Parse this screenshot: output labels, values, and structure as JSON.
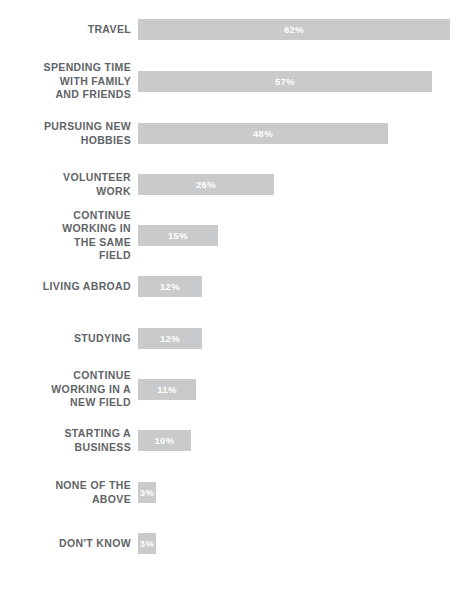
{
  "chart_data": {
    "type": "bar",
    "orientation": "horizontal",
    "title": "",
    "subtitle": "",
    "xlabel": "",
    "ylabel": "",
    "xlim": [
      0,
      62
    ],
    "grid": false,
    "legend": false,
    "value_suffix": "%",
    "bar_color": "#c9cacb",
    "value_label_color": "#ffffff",
    "category_label_color": "#5f6468",
    "background": "#ffffff",
    "categories": [
      "TRAVEL",
      "SPENDING TIME\nWITH FAMILY\nAND FRIENDS",
      "PURSUING NEW\nHOBBIES",
      "VOLUNTEER\nWORK",
      "CONTINUE\nWORKING IN\nTHE SAME\nFIELD",
      "LIVING ABROAD",
      "STUDYING",
      "CONTINUE\nWORKING IN A\nNEW FIELD",
      "STARTING A\nBUSINESS",
      "NONE OF THE\nABOVE",
      "DON'T KNOW"
    ],
    "values": [
      62,
      57,
      48,
      26,
      15,
      12,
      12,
      11,
      10,
      3,
      3
    ],
    "value_labels": [
      "62%",
      "57%",
      "48%",
      "26%",
      "15%",
      "12%",
      "12%",
      "11%",
      "10%",
      "3%",
      "3%"
    ]
  },
  "rows": [
    {
      "label": "TRAVEL",
      "value": 62,
      "value_label": "62%",
      "bar_px": 312,
      "top_px": 30
    },
    {
      "label": "SPENDING TIME\nWITH FAMILY\nAND FRIENDS",
      "value": 57,
      "value_label": "57%",
      "bar_px": 294,
      "top_px": 82
    },
    {
      "label": "PURSUING NEW\nHOBBIES",
      "value": 48,
      "value_label": "48%",
      "bar_px": 250,
      "top_px": 134
    },
    {
      "label": "VOLUNTEER\nWORK",
      "value": 26,
      "value_label": "26%",
      "bar_px": 136,
      "top_px": 185
    },
    {
      "label": "CONTINUE\nWORKING IN\nTHE SAME\nFIELD",
      "value": 15,
      "value_label": "15%",
      "bar_px": 80,
      "top_px": 236
    },
    {
      "label": "LIVING ABROAD",
      "value": 12,
      "value_label": "12%",
      "bar_px": 64,
      "top_px": 287
    },
    {
      "label": "STUDYING",
      "value": 12,
      "value_label": "12%",
      "bar_px": 64,
      "top_px": 339
    },
    {
      "label": "CONTINUE\nWORKING IN A\nNEW FIELD",
      "value": 11,
      "value_label": "11%",
      "bar_px": 58,
      "top_px": 390
    },
    {
      "label": "STARTING A\nBUSINESS",
      "value": 10,
      "value_label": "10%",
      "bar_px": 53,
      "top_px": 441
    },
    {
      "label": "NONE OF THE\nABOVE",
      "value": 3,
      "value_label": "3%",
      "bar_px": 18,
      "top_px": 493
    },
    {
      "label": "DON'T KNOW",
      "value": 3,
      "value_label": "3%",
      "bar_px": 18,
      "top_px": 544
    }
  ]
}
